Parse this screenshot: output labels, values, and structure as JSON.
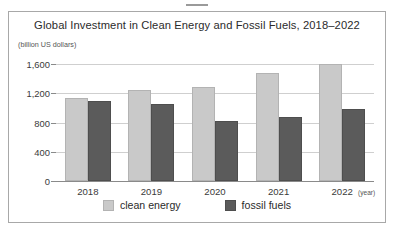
{
  "top_mark": {
    "name": "redaction-dash"
  },
  "chart_data": {
    "type": "bar",
    "title": "Global Investment in Clean Energy and Fossil Fuels, 2018–2022",
    "ylabel": "(billion US dollars)",
    "xlabel": "(year)",
    "categories": [
      "2018",
      "2019",
      "2020",
      "2021",
      "2022"
    ],
    "series": [
      {
        "name": "clean energy",
        "color": "#c9c9c9",
        "values": [
          1130,
          1240,
          1290,
          1480,
          1600
        ]
      },
      {
        "name": "fossil fuels",
        "color": "#5b5b5b",
        "values": [
          1100,
          1060,
          820,
          880,
          980
        ]
      }
    ],
    "ylim": [
      0,
      1600
    ],
    "yticks": [
      0,
      400,
      800,
      1200,
      1600
    ],
    "ytick_labels": [
      "0",
      "400",
      "800",
      "1,200",
      "1,600"
    ],
    "grid": true,
    "legend_position": "bottom"
  }
}
